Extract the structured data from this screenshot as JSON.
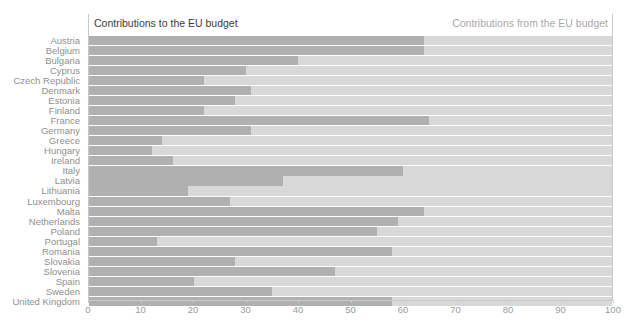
{
  "header": {
    "left_title": "Contributions to the EU budget",
    "right_title": "Contributions from the EU budget"
  },
  "colors": {
    "bar_to": "#b0b0b0",
    "bar_from": "#d8d8d8",
    "axis": "#c9c9c9",
    "label": "#8f8f8f",
    "title_left": "#3b3b3b",
    "title_right": "#a9a9a9"
  },
  "chart_data": {
    "type": "bar",
    "orientation": "horizontal",
    "stacked": true,
    "title": "Contributions to the EU budget",
    "xlabel": "",
    "ylabel": "",
    "xlim": [
      0,
      100
    ],
    "grid": false,
    "legend_position": "top",
    "xticks": [
      0,
      10,
      20,
      30,
      40,
      50,
      60,
      70,
      80,
      90,
      100
    ],
    "xtick_labels": [
      "0",
      "10",
      "20",
      "30",
      "40",
      "50",
      "60",
      "70",
      "80",
      "90",
      "100"
    ],
    "categories": [
      "Austria",
      "Belgium",
      "Bulgaria",
      "Cyprus",
      "Czech Republic",
      "Denmark",
      "Estonia",
      "Finland",
      "France",
      "Germany",
      "Greece",
      "Hungary",
      "Ireland",
      "Italy",
      "Latvia",
      "Lithuania",
      "Luxembourg",
      "Malta",
      "Netherlands",
      "Poland",
      "Portugal",
      "Romania",
      "Slovakia",
      "Slovenia",
      "Spain",
      "Sweden",
      "United Kingdom"
    ],
    "series": [
      {
        "name": "Contributions to the EU budget",
        "color": "#b0b0b0",
        "values": [
          64,
          64,
          40,
          30,
          22,
          31,
          28,
          22,
          65,
          31,
          14,
          12,
          16,
          60,
          37,
          19,
          27,
          64,
          59,
          55,
          13,
          58,
          28,
          47,
          20,
          35,
          58
        ]
      },
      {
        "name": "Contributions from the EU budget",
        "color": "#d8d8d8",
        "values": [
          36,
          36,
          60,
          70,
          78,
          69,
          72,
          78,
          35,
          69,
          86,
          88,
          84,
          40,
          63,
          81,
          73,
          36,
          41,
          45,
          87,
          42,
          72,
          53,
          80,
          65,
          42
        ]
      }
    ]
  }
}
